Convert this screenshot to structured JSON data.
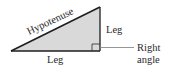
{
  "diagram": {
    "type": "right-triangle",
    "labels": {
      "hypotenuse": "Hypotenuse",
      "leg_vertical": "Leg",
      "leg_horizontal": "Leg",
      "right_angle_line1": "Right",
      "right_angle_line2": "angle"
    },
    "colors": {
      "fill": "#d9d9d9",
      "stroke": "#1e1e1e",
      "leader": "#8a8a8a",
      "text": "#2a2a2a"
    }
  }
}
